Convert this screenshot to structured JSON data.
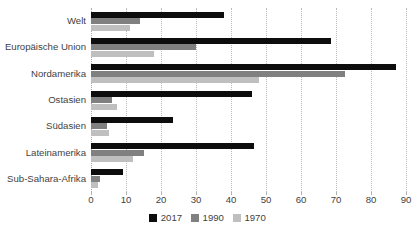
{
  "chart_data": {
    "type": "bar",
    "orientation": "horizontal",
    "title": "",
    "xlabel": "",
    "ylabel": "",
    "xlim": [
      0,
      90
    ],
    "xticks": [
      0,
      10,
      20,
      30,
      40,
      50,
      60,
      70,
      80,
      90
    ],
    "grid": true,
    "legend_position": "bottom",
    "categories": [
      "Welt",
      "Europäische Union",
      "Nordamerika",
      "Ostasien",
      "Südasien",
      "Lateinamerika",
      "Sub-Sahara-Afrika"
    ],
    "series": [
      {
        "name": "2017",
        "color": "#0d0d0d",
        "values": [
          38,
          68.5,
          87,
          46,
          23.5,
          46.5,
          9
        ]
      },
      {
        "name": "1990",
        "color": "#808080",
        "values": [
          14,
          30,
          72.5,
          6,
          4.5,
          15,
          2.5
        ]
      },
      {
        "name": "1970",
        "color": "#bfbfbf",
        "values": [
          11,
          18,
          48,
          7.5,
          5,
          12,
          2
        ]
      }
    ]
  }
}
